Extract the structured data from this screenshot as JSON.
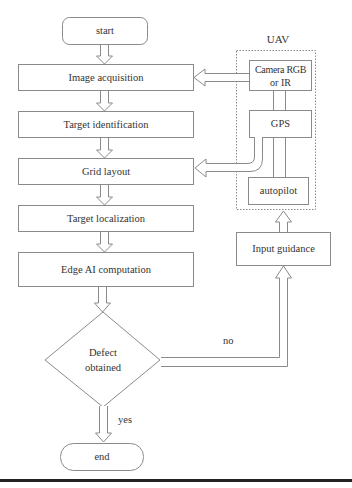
{
  "diagram": {
    "type": "flowchart",
    "main_flow": {
      "start": "start",
      "steps": [
        "Image acquisition",
        "Target identification",
        "Grid layout",
        "Target localization",
        "Edge AI computation"
      ],
      "decision": {
        "line1": "Defect",
        "line2": "obtained",
        "yes_label": "yes",
        "no_label": "no"
      },
      "end": "end"
    },
    "uav": {
      "title": "UAV",
      "components": {
        "camera_line1": "Camera RGB",
        "camera_line2": "or IR",
        "gps": "GPS",
        "autopilot": "autopilot"
      }
    },
    "input_guidance": "Input guidance",
    "edges": [
      {
        "from": "start",
        "to": "Image acquisition"
      },
      {
        "from": "Image acquisition",
        "to": "Target identification"
      },
      {
        "from": "Target identification",
        "to": "Grid layout"
      },
      {
        "from": "Grid layout",
        "to": "Target localization"
      },
      {
        "from": "Target localization",
        "to": "Edge AI computation"
      },
      {
        "from": "Edge AI computation",
        "to": "Defect obtained"
      },
      {
        "from": "Defect obtained",
        "to": "end",
        "label": "yes"
      },
      {
        "from": "Defect obtained",
        "to": "Input guidance",
        "label": "no"
      },
      {
        "from": "Input guidance",
        "to": "autopilot"
      },
      {
        "from": "Camera RGB or IR",
        "to": "Image acquisition"
      },
      {
        "from": "GPS",
        "to": "Grid layout"
      }
    ],
    "colors": {
      "stroke": "#8a8a8a",
      "text": "#333333",
      "background": "#ffffff",
      "rule": "#222222"
    }
  }
}
